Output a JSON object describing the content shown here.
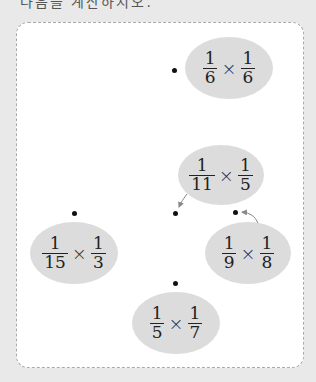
{
  "header": {
    "cut_text": "다음을 계산하시오."
  },
  "items": [
    {
      "id": "a",
      "left": {
        "num": "1",
        "den": "6"
      },
      "right": {
        "num": "1",
        "den": "6"
      },
      "operator": "×"
    },
    {
      "id": "b",
      "left": {
        "num": "1",
        "den": "11"
      },
      "right": {
        "num": "1",
        "den": "5"
      },
      "operator": "×"
    },
    {
      "id": "c",
      "left": {
        "num": "1",
        "den": "15"
      },
      "right": {
        "num": "1",
        "den": "3"
      },
      "operator": "×"
    },
    {
      "id": "d",
      "left": {
        "num": "1",
        "den": "9"
      },
      "right": {
        "num": "1",
        "den": "8"
      },
      "operator": "×"
    },
    {
      "id": "e",
      "left": {
        "num": "1",
        "den": "5"
      },
      "right": {
        "num": "1",
        "den": "7"
      },
      "operator": "×"
    }
  ],
  "colors": {
    "oval": "#dcdcdc",
    "background": "#e9e9e9",
    "panel": "#ffffff",
    "arrow": "#888888"
  }
}
